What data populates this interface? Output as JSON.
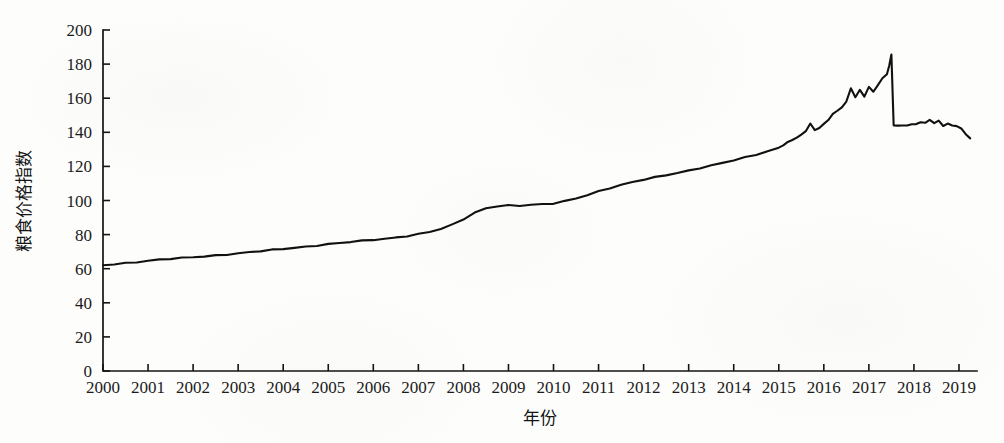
{
  "chart_data": {
    "type": "line",
    "title": "",
    "xlabel": "年份",
    "ylabel": "粮食价格指数",
    "xlim": [
      2000,
      2019.4
    ],
    "ylim": [
      0,
      200
    ],
    "grid": false,
    "legend": null,
    "y_ticks": [
      0,
      20,
      40,
      60,
      80,
      100,
      120,
      140,
      160,
      180,
      200
    ],
    "y_tick_labels": [
      "0",
      "20",
      "40",
      "60",
      "80",
      "100",
      "120",
      "140",
      "160",
      "180",
      "200"
    ],
    "x_ticks": [
      2000,
      2001,
      2002,
      2003,
      2004,
      2005,
      2006,
      2007,
      2008,
      2009,
      2010,
      2011,
      2012,
      2013,
      2014,
      2015,
      2016,
      2017,
      2018,
      2019
    ],
    "x_tick_labels": [
      "2000",
      "2001",
      "2002",
      "2003",
      "2004",
      "2005",
      "2006",
      "2007",
      "2008",
      "2009",
      "2010",
      "2011",
      "2012",
      "2013",
      "2014",
      "2015",
      "2016",
      "2017",
      "2018",
      "2019"
    ],
    "series": [
      {
        "name": "粮食价格指数",
        "color": "#111111",
        "x": [
          2000.0,
          2000.25,
          2000.5,
          2000.75,
          2001.0,
          2001.25,
          2001.5,
          2001.75,
          2002.0,
          2002.25,
          2002.5,
          2002.75,
          2003.0,
          2003.25,
          2003.5,
          2003.75,
          2004.0,
          2004.25,
          2004.5,
          2004.75,
          2005.0,
          2005.25,
          2005.5,
          2005.75,
          2006.0,
          2006.25,
          2006.5,
          2006.75,
          2007.0,
          2007.25,
          2007.5,
          2007.75,
          2008.0,
          2008.25,
          2008.5,
          2008.75,
          2009.0,
          2009.25,
          2009.5,
          2009.75,
          2010.0,
          2010.25,
          2010.5,
          2010.75,
          2011.0,
          2011.25,
          2011.5,
          2011.75,
          2012.0,
          2012.25,
          2012.5,
          2012.75,
          2013.0,
          2013.25,
          2013.5,
          2013.75,
          2014.0,
          2014.25,
          2014.5,
          2014.75,
          2015.0,
          2015.1,
          2015.2,
          2015.3,
          2015.4,
          2015.5,
          2015.6,
          2015.7,
          2015.8,
          2015.9,
          2016.0,
          2016.1,
          2016.2,
          2016.3,
          2016.4,
          2016.5,
          2016.6,
          2016.7,
          2016.8,
          2016.9,
          2017.0,
          2017.1,
          2017.2,
          2017.3,
          2017.4,
          2017.45,
          2017.5,
          2017.55,
          2017.65,
          2017.75,
          2017.85,
          2017.95,
          2018.05,
          2018.15,
          2018.25,
          2018.35,
          2018.45,
          2018.55,
          2018.65,
          2018.75,
          2018.85,
          2018.95,
          2019.05,
          2019.15,
          2019.25
        ],
        "y": [
          62.0,
          62.8,
          63.4,
          64.0,
          64.6,
          65.2,
          65.7,
          66.2,
          66.8,
          67.3,
          67.9,
          68.4,
          69.0,
          69.6,
          70.2,
          70.9,
          71.6,
          72.3,
          73.0,
          73.7,
          74.4,
          75.0,
          75.6,
          76.2,
          76.9,
          77.6,
          78.4,
          79.3,
          80.3,
          81.6,
          83.2,
          85.6,
          89.0,
          92.8,
          95.6,
          96.8,
          97.2,
          96.9,
          97.3,
          97.6,
          98.2,
          99.6,
          101.4,
          103.4,
          105.4,
          107.3,
          109.0,
          110.6,
          112.2,
          113.6,
          115.0,
          116.3,
          117.6,
          119.0,
          120.4,
          121.9,
          123.5,
          125.2,
          127.0,
          129.0,
          131.0,
          132.6,
          134.0,
          135.4,
          136.8,
          138.4,
          141.0,
          145.2,
          141.4,
          142.8,
          144.6,
          147.2,
          150.6,
          152.4,
          155.0,
          158.0,
          166.0,
          160.8,
          164.6,
          161.0,
          166.4,
          163.6,
          168.0,
          171.6,
          174.4,
          179.0,
          185.4,
          144.2,
          143.6,
          143.9,
          144.2,
          144.6,
          145.2,
          146.0,
          145.4,
          147.4,
          145.0,
          146.8,
          143.8,
          145.0,
          144.4,
          143.6,
          142.2,
          139.0,
          136.0
        ]
      }
    ]
  },
  "axes": {
    "y_axis_title": "粮食价格指数",
    "x_axis_title": "年份"
  }
}
